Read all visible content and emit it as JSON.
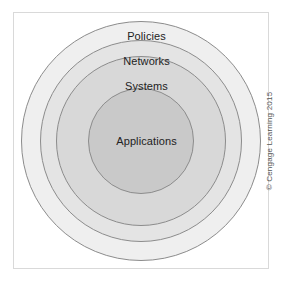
{
  "figure": {
    "type": "concentric-circles",
    "credit": "© Cengage Learning 2015",
    "rings": [
      {
        "label": "Policies",
        "level": 1,
        "fill": "#efefef",
        "stroke": "#8c8c8c"
      },
      {
        "label": "Networks",
        "level": 2,
        "fill": "#e4e4e4",
        "stroke": "#8c8c8c"
      },
      {
        "label": "Systems",
        "level": 3,
        "fill": "#d8d8d8",
        "stroke": "#8c8c8c"
      },
      {
        "label": "Applications",
        "level": 4,
        "fill": "#c9c9c9",
        "stroke": "#8c8c8c"
      }
    ],
    "frame_color": "#d9d9d9",
    "background": "#ffffff"
  }
}
